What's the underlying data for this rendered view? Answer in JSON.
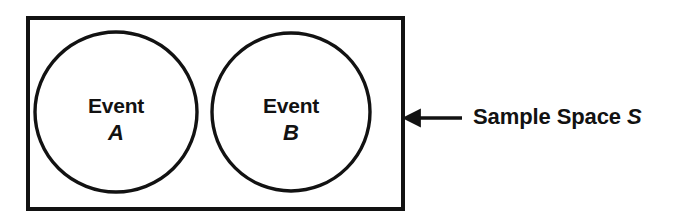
{
  "diagram": {
    "type": "venn-diagram",
    "stroke_color": "#121212",
    "fill_color": "#ffffff",
    "background_color": "#ffffff",
    "sample_space": {
      "shape": "rectangle",
      "x": 26,
      "y": 16,
      "width": 379,
      "height": 195,
      "stroke_width": 4
    },
    "events": [
      {
        "id": "event-a",
        "word": "Event",
        "symbol": "A",
        "shape": "ellipse",
        "cx": 116,
        "cy": 112,
        "rx": 81,
        "ry": 80,
        "stroke_width": 3.4
      },
      {
        "id": "event-b",
        "word": "Event",
        "symbol": "B",
        "shape": "ellipse",
        "cx": 291,
        "cy": 112,
        "rx": 79,
        "ry": 79,
        "stroke_width": 3.4
      }
    ],
    "annotation": {
      "label_prefix": "Sample Space ",
      "label_symbol": "S",
      "arrow": {
        "direction": "left",
        "tip_x": 402,
        "tail_x": 462,
        "y": 118,
        "shaft_width": 3.5,
        "head_width": 19,
        "head_height": 21
      }
    }
  }
}
